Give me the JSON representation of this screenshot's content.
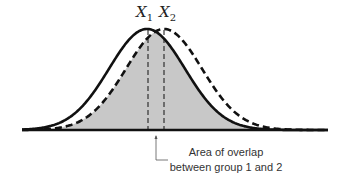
{
  "diagram": {
    "title": "",
    "labels": {
      "x1": "X",
      "x1_sub": "1",
      "x2": "X",
      "x2_sub": "2"
    },
    "annotation": {
      "line1": "Area of overlap",
      "line2": "between group 1 and 2"
    },
    "curves": [
      {
        "name": "group 1",
        "style": "solid",
        "mean_px": 147
      },
      {
        "name": "group 2",
        "style": "dashed",
        "mean_px": 164
      }
    ],
    "colors": {
      "curve": "#111111",
      "overlap_fill": "#c8c8c8",
      "baseline": "#111111"
    }
  }
}
